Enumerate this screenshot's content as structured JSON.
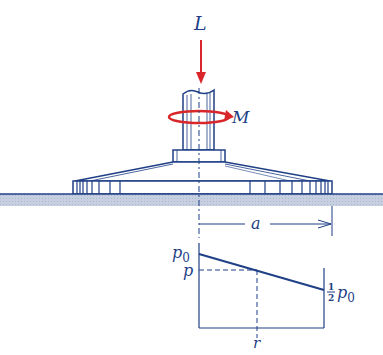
{
  "figure": {
    "labels": {
      "load": "L",
      "moment": "M",
      "radius_dim": "a",
      "p0": "p",
      "p0_sub": "0",
      "p": "p",
      "half_num": "1",
      "half_den": "2",
      "half_p": "p",
      "half_sub": "0",
      "r": "r"
    },
    "colors": {
      "ink": "#1f3f86",
      "force": "#d8262a",
      "ground": "#c9d3e3"
    }
  }
}
